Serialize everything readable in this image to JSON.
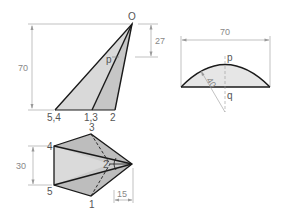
{
  "front_view": {
    "apex_label": "O",
    "point_label_p": "p",
    "base_labels": [
      "5,4",
      "1,3",
      "2"
    ],
    "dim_height": "70",
    "dim_offset": "27"
  },
  "section_view": {
    "dim_width": "70",
    "radius": "40",
    "label_p": "p",
    "label_q": "q"
  },
  "top_view": {
    "labels": {
      "p1": "1",
      "p2": "2",
      "p3": "3",
      "p4": "4",
      "p5": "5"
    },
    "dim_width": "30",
    "dim_offset": "15"
  },
  "colors": {
    "fill_light": "#dcdcdc",
    "fill_mid": "#c8c8c8",
    "line": "#1a1a1a",
    "dim_line": "#999999"
  }
}
